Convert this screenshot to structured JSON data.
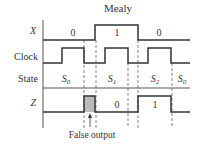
{
  "title": "Mealy",
  "signals": {
    "x": {
      "label": "X",
      "segments": [
        "0",
        "1",
        "0"
      ]
    },
    "clock": {
      "label": "Clock"
    },
    "state": {
      "label": "State",
      "values": [
        "S0",
        "S1",
        "S2",
        "S0"
      ]
    },
    "z": {
      "label": "Z",
      "values": [
        "0",
        "1"
      ]
    }
  },
  "annotation": "False output",
  "colors": {
    "line": "#333333",
    "false_output_fill": "#bbbbbb",
    "dashed": "#666666"
  }
}
